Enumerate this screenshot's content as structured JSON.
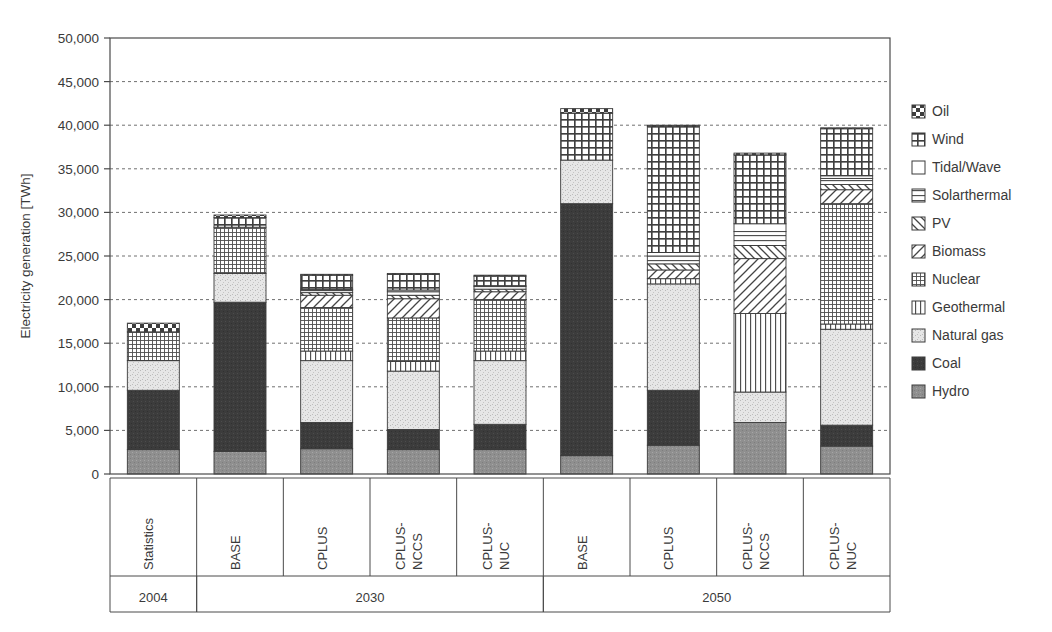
{
  "chart_data": {
    "type": "bar",
    "variant": "stacked",
    "title": "",
    "xlabel": "",
    "ylabel": "Electricity generation [TWh]",
    "ylim": [
      0,
      50000
    ],
    "ytick_step": 5000,
    "ytick_labels": [
      "0",
      "5,000",
      "10,000",
      "15,000",
      "20,000",
      "25,000",
      "30,000",
      "35,000",
      "40,000",
      "45,000",
      "50,000"
    ],
    "ytick_values": [
      0,
      5000,
      10000,
      15000,
      20000,
      25000,
      30000,
      35000,
      40000,
      45000,
      50000
    ],
    "grid": true,
    "grid_axis": "y",
    "legend_position": "right",
    "legend_order_top_to_bottom": [
      "Oil",
      "Wind",
      "Tidal/Wave",
      "Solarthermal",
      "PV",
      "Biomass",
      "Nuclear",
      "Geothermal",
      "Natural gas",
      "Coal",
      "Hydro"
    ],
    "stack_order_bottom_to_top": [
      "Hydro",
      "Coal",
      "Natural gas",
      "Geothermal",
      "Nuclear",
      "Biomass",
      "PV",
      "Solarthermal",
      "Tidal/Wave",
      "Wind",
      "Oil"
    ],
    "categories": [
      "Statistics",
      "BASE",
      "CPLUS",
      "CPLUS-NCCS",
      "CPLUS-NUC",
      "BASE",
      "CPLUS",
      "CPLUS-NCCS",
      "CPLUS-NUC"
    ],
    "group_labels": [
      "2004",
      "2030",
      "2050"
    ],
    "group_spans": [
      1,
      4,
      4
    ],
    "series": [
      {
        "name": "Hydro",
        "values": [
          2800,
          2600,
          2900,
          2800,
          2800,
          2100,
          3300,
          5900,
          3200
        ]
      },
      {
        "name": "Coal",
        "values": [
          6800,
          17100,
          3000,
          2300,
          2900,
          28900,
          6300,
          0,
          2400
        ]
      },
      {
        "name": "Natural gas",
        "values": [
          3400,
          3300,
          7100,
          6700,
          7300,
          5000,
          12200,
          3500,
          11000
        ]
      },
      {
        "name": "Geothermal",
        "values": [
          0,
          0,
          1100,
          1100,
          1100,
          0,
          600,
          9000,
          600
        ]
      },
      {
        "name": "Nuclear",
        "values": [
          3300,
          5300,
          5000,
          5000,
          5900,
          0,
          0,
          0,
          13800
        ]
      },
      {
        "name": "Biomass",
        "values": [
          0,
          0,
          1400,
          2200,
          900,
          0,
          1000,
          6300,
          1600
        ]
      },
      {
        "name": "PV",
        "values": [
          0,
          0,
          300,
          400,
          300,
          0,
          700,
          1500,
          600
        ]
      },
      {
        "name": "Solarthermal",
        "values": [
          0,
          0,
          300,
          400,
          300,
          0,
          900,
          1600,
          700
        ]
      },
      {
        "name": "Tidal/Wave",
        "values": [
          0,
          0,
          100,
          200,
          100,
          0,
          400,
          900,
          300
        ]
      },
      {
        "name": "Wind",
        "values": [
          0,
          1100,
          1600,
          1800,
          1100,
          5400,
          14500,
          7900,
          5400
        ]
      },
      {
        "name": "Oil",
        "values": [
          1000,
          300,
          100,
          100,
          100,
          500,
          100,
          200,
          100
        ]
      }
    ],
    "totals": [
      17300,
      29700,
      22900,
      23000,
      22800,
      41900,
      40000,
      36800,
      39700
    ],
    "patterns": {
      "Hydro": "solid-gray",
      "Coal": "solid-dark",
      "Natural gas": "speckle-light",
      "Geothermal": "vertical-lines",
      "Nuclear": "fine-grid",
      "Biomass": "diagonal-lines",
      "PV": "diagonal-back",
      "Solarthermal": "horizontal-lines",
      "Tidal/Wave": "blank",
      "Wind": "cross-grid",
      "Oil": "checkerboard"
    },
    "colors": {
      "Hydro": "#8c8c8c",
      "Coal": "#3b3b3b",
      "Natural gas": "#e0e0e0",
      "Geothermal": "#ffffff",
      "Nuclear": "#ffffff",
      "Biomass": "#ffffff",
      "PV": "#ffffff",
      "Solarthermal": "#ffffff",
      "Tidal/Wave": "#ffffff",
      "Wind": "#ffffff",
      "Oil": "#ffffff",
      "axis": "#4a4a4a",
      "grid": "#707070",
      "text": "#3a3a3a"
    }
  }
}
